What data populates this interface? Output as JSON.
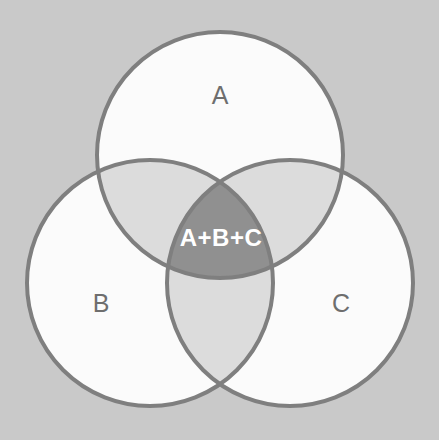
{
  "figure": {
    "type": "venn-diagram",
    "background_color": "#c9c9c9",
    "stroke_color": "#7f7f7f",
    "stroke_width": 4,
    "set_fill_color": "#fbfbfb",
    "pair_overlap_color": "#dcdcdc",
    "triple_overlap_color": "#909090",
    "label_color": "#6e6e6e",
    "center_label_color": "#ffffff"
  },
  "sets": [
    {
      "id": "A",
      "label": "A",
      "label_x": 220,
      "label_y": 97,
      "center_x": 220,
      "center_y": 155,
      "radius": 123
    },
    {
      "id": "B",
      "label": "B",
      "label_x": 101,
      "label_y": 305,
      "center_x": 150,
      "center_y": 283,
      "radius": 123
    },
    {
      "id": "C",
      "label": "C",
      "label_x": 341,
      "label_y": 305,
      "center_x": 290,
      "center_y": 283,
      "radius": 123
    }
  ],
  "intersections": {
    "triple": {
      "id": "A+B+C",
      "label": "A+B+C",
      "label_x": 221,
      "label_y": 240
    }
  },
  "chart_data": {
    "type": "venn",
    "sets": [
      "A",
      "B",
      "C"
    ],
    "labels": [
      "A",
      "B",
      "C",
      "A+B+C"
    ],
    "regions": [
      {
        "name": "A",
        "label": "A",
        "shade": "white"
      },
      {
        "name": "B",
        "label": "B",
        "shade": "white"
      },
      {
        "name": "C",
        "label": "C",
        "shade": "white"
      },
      {
        "name": "A∩B",
        "label": "",
        "shade": "light-gray"
      },
      {
        "name": "A∩C",
        "label": "",
        "shade": "light-gray"
      },
      {
        "name": "B∩C",
        "label": "",
        "shade": "light-gray"
      },
      {
        "name": "A∩B∩C",
        "label": "A+B+C",
        "shade": "dark-gray"
      }
    ],
    "legend": "none",
    "grid": false
  }
}
